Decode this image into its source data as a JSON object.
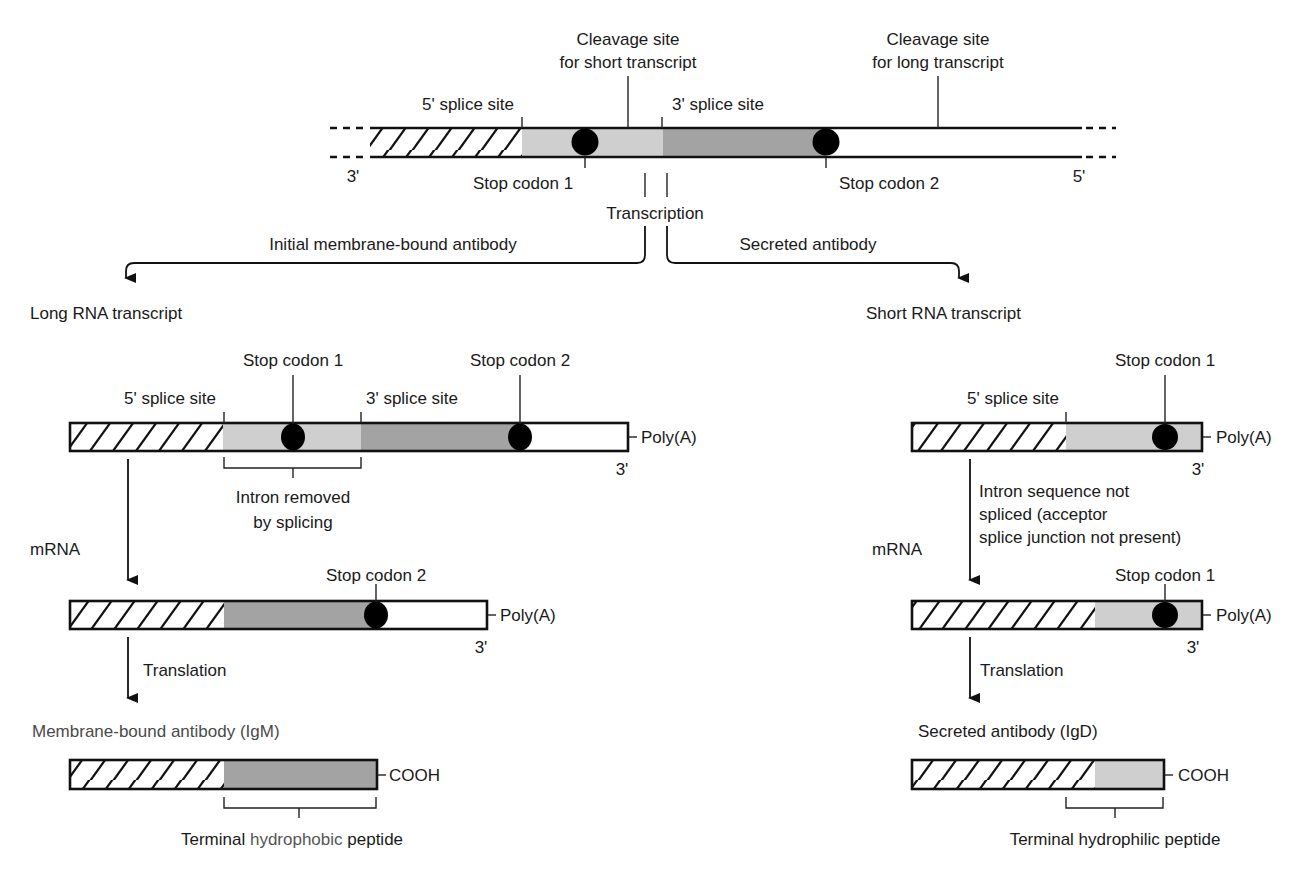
{
  "colors": {
    "light_segment": "#cfcfcf",
    "dark_segment": "#a3a3a3",
    "outline": "#111111",
    "stop_codon": "#000000"
  },
  "gene": {
    "cleavage_short": [
      "Cleavage site",
      "for short transcript"
    ],
    "cleavage_long": [
      "Cleavage site",
      "for long transcript"
    ],
    "splice5": "5' splice site",
    "splice3": "3' splice site",
    "stop1": "Stop codon 1",
    "stop2": "Stop codon 2",
    "end_left": "3'",
    "end_right": "5'"
  },
  "branch": {
    "transcription": "Transcription",
    "left_label": "Initial membrane-bound antibody",
    "right_label": "Secreted antibody"
  },
  "left": {
    "title": "Long RNA transcript",
    "stop1": "Stop codon 1",
    "stop2": "Stop codon 2",
    "splice5": "5' splice site",
    "splice3": "3' splice site",
    "polya": "Poly(A)",
    "end3": "3'",
    "intron": [
      "Intron removed",
      "by splicing"
    ],
    "mrna": "mRNA",
    "mrna_stop2": "Stop codon 2",
    "mrna_polya": "Poly(A)",
    "mrna_end3": "3'",
    "translation": "Translation",
    "product": "Membrane-bound antibody (IgM)",
    "cooh": "COOH",
    "peptide_pre": "Terminal ",
    "peptide_mid": "hydrophobic",
    "peptide_post": " peptide"
  },
  "right": {
    "title": "Short RNA transcript",
    "stop1": "Stop codon 1",
    "splice5": "5' splice site",
    "polya": "Poly(A)",
    "end3": "3'",
    "note": [
      "Intron sequence not",
      "spliced (acceptor",
      "splice junction not present)"
    ],
    "mrna": "mRNA",
    "mrna_stop1": "Stop codon 1",
    "mrna_polya": "Poly(A)",
    "mrna_end3": "3'",
    "translation": "Translation",
    "product": "Secreted antibody (IgD)",
    "cooh": "COOH",
    "peptide": "Terminal hydrophilic peptide"
  }
}
